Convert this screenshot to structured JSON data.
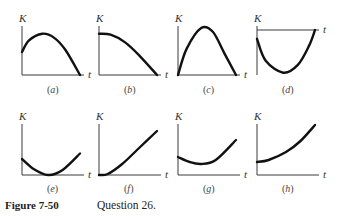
{
  "figure": {
    "caption_label": "Figure 7-50",
    "caption_text": "Question 26.",
    "y_axis_label": "K",
    "x_axis_label": "t",
    "panels": [
      {
        "id": "a",
        "label": "a",
        "description": "K starts positive, rises to a maximum, then decreases to zero",
        "axis_position": "bottom",
        "points": [
          [
            0,
            0.48
          ],
          [
            0.12,
            0.72
          ],
          [
            0.35,
            0.86
          ],
          [
            0.55,
            0.78
          ],
          [
            0.75,
            0.52
          ],
          [
            1.0,
            0.0
          ]
        ]
      },
      {
        "id": "b",
        "label": "b",
        "description": "K starts at a maximum and decreases to zero",
        "axis_position": "bottom",
        "points": [
          [
            0,
            0.86
          ],
          [
            0.2,
            0.84
          ],
          [
            0.45,
            0.68
          ],
          [
            0.7,
            0.4
          ],
          [
            1.0,
            0.0
          ]
        ]
      },
      {
        "id": "c",
        "label": "c",
        "description": "K starts at zero, rises to a maximum, then returns to zero",
        "axis_position": "bottom",
        "points": [
          [
            0,
            0
          ],
          [
            0.15,
            0.55
          ],
          [
            0.4,
            0.98
          ],
          [
            0.6,
            0.9
          ],
          [
            0.8,
            0.45
          ],
          [
            1.0,
            0.0
          ]
        ]
      },
      {
        "id": "d",
        "label": "d",
        "description": "K starts at zero and dips below the t-axis (negative), then returns to zero",
        "axis_position": "top",
        "points": [
          [
            0,
            -0.2
          ],
          [
            0.15,
            -0.7
          ],
          [
            0.45,
            -0.97
          ],
          [
            0.7,
            -0.8
          ],
          [
            0.9,
            -0.35
          ],
          [
            1.0,
            0.0
          ]
        ]
      },
      {
        "id": "e",
        "label": "e",
        "description": "K starts positive, decreases to zero, then increases",
        "axis_position": "bottom",
        "points": [
          [
            0,
            0.32
          ],
          [
            0.2,
            0.12
          ],
          [
            0.45,
            0.0
          ],
          [
            0.7,
            0.1
          ],
          [
            1.0,
            0.43
          ]
        ]
      },
      {
        "id": "f",
        "label": "f",
        "description": "K starts at zero and increases",
        "axis_position": "bottom",
        "points": [
          [
            0,
            0
          ],
          [
            0.15,
            0.02
          ],
          [
            0.4,
            0.22
          ],
          [
            0.7,
            0.55
          ],
          [
            1.0,
            0.88
          ]
        ]
      },
      {
        "id": "g",
        "label": "g",
        "description": "K starts positive, decreases to a positive minimum, then increases",
        "axis_position": "bottom",
        "points": [
          [
            0,
            0.36
          ],
          [
            0.2,
            0.26
          ],
          [
            0.4,
            0.22
          ],
          [
            0.65,
            0.3
          ],
          [
            1.0,
            0.7
          ]
        ]
      },
      {
        "id": "h",
        "label": "h",
        "description": "K starts positive and increases",
        "axis_position": "bottom",
        "points": [
          [
            0,
            0.26
          ],
          [
            0.2,
            0.3
          ],
          [
            0.5,
            0.46
          ],
          [
            0.75,
            0.68
          ],
          [
            1.0,
            1.0
          ]
        ]
      }
    ]
  }
}
